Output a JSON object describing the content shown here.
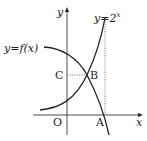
{
  "diagram": {
    "axes": {
      "x_label": "x",
      "y_label": "y",
      "origin_label": "O"
    },
    "curves": [
      {
        "name": "exponential",
        "label": "y=2",
        "exponent": "x"
      },
      {
        "name": "function-f",
        "label": "y=f(x)"
      }
    ],
    "points": {
      "A": "A",
      "B": "B",
      "C": "C"
    },
    "colors": {
      "stroke": "#222222",
      "background": "#ffffff"
    }
  }
}
